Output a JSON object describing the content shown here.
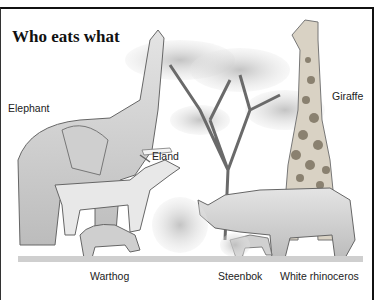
{
  "title": "Who eats what",
  "labels": {
    "elephant": "Elephant",
    "eland": "Eland",
    "giraffe": "Giraffe",
    "warthog": "Warthog",
    "steenbok": "Steenbok",
    "white_rhinoceros": "White rhinoceros"
  },
  "colors": {
    "border": "#111111",
    "text": "#222222",
    "shade": "#c8c8c8"
  }
}
